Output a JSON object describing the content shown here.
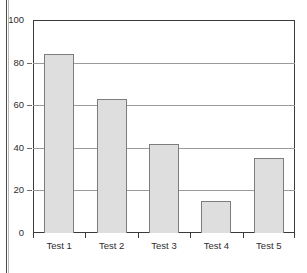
{
  "chart_data": {
    "type": "bar",
    "title": "",
    "subtitle": "",
    "xlabel": "",
    "ylabel": "",
    "categories": [
      "Test 1",
      "Test 2",
      "Test 3",
      "Test 4",
      "Test 5"
    ],
    "values": [
      84,
      63,
      42,
      15,
      35
    ],
    "ylim": [
      0,
      100
    ],
    "yticks": [
      0,
      20,
      40,
      60,
      80,
      100
    ],
    "ytick_labels": [
      "0",
      "20",
      "40",
      "60",
      "80",
      "100"
    ],
    "grid": true,
    "grid_axis": "y",
    "legend": false,
    "legend_position": "none",
    "bar_fill_color": "#dedede",
    "bar_border_color": "#7d7d7d",
    "gridline_color": "#9b9b9b",
    "axis_color": "#3a3a3a",
    "background_color": "#ffffff",
    "text_color": "#2e2e2e"
  },
  "figure": {
    "name": "bar-chart-figure",
    "page_rule_color": "#4a4a4a"
  }
}
